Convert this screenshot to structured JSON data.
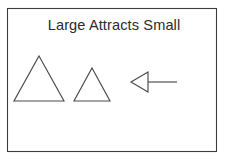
{
  "figure": {
    "title": "Large Attracts Small",
    "background_color": "#ffffff",
    "border_color": "#3c3c3c",
    "stroke_color": "#4a4a4a",
    "text_color": "#2b2b2b",
    "panel": {
      "x": 7,
      "y": 8,
      "width": 210,
      "height": 144
    },
    "title_position": {
      "x": 114,
      "y": 30
    },
    "shapes": [
      {
        "name": "large-triangle",
        "type": "triangle",
        "role": "large body",
        "apex": {
          "x": 39,
          "y": 56
        },
        "base_left": {
          "x": 14,
          "y": 101
        },
        "base_right": {
          "x": 64,
          "y": 101
        },
        "width": 50,
        "height": 45
      },
      {
        "name": "small-triangle",
        "type": "triangle",
        "role": "small body",
        "apex": {
          "x": 92,
          "y": 68
        },
        "base_left": {
          "x": 74,
          "y": 101
        },
        "base_right": {
          "x": 110,
          "y": 101
        },
        "width": 36,
        "height": 33
      },
      {
        "name": "attraction-arrow",
        "type": "arrow",
        "role": "force direction",
        "direction": "left",
        "tip": {
          "x": 131,
          "y": 82
        },
        "head_back_top": {
          "x": 148,
          "y": 72
        },
        "head_back_bottom": {
          "x": 148,
          "y": 92
        },
        "shaft_start": {
          "x": 148,
          "y": 82
        },
        "shaft_end": {
          "x": 177,
          "y": 82
        }
      }
    ]
  }
}
